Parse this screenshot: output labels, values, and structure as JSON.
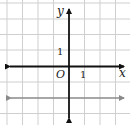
{
  "diagram": {
    "type": "coordinate-plane",
    "axes": {
      "x_label": "x",
      "y_label": "y",
      "origin_label": "O",
      "x_tick_label": "1",
      "y_tick_label": "1",
      "color": "#111111"
    },
    "grid": {
      "color": "#cfcfcf",
      "unit_px": 15.5,
      "x_range": [
        -4,
        3
      ],
      "y_range": [
        -3,
        4
      ]
    },
    "lines": [
      {
        "name": "horizontal-line-y-neg2",
        "equation": "y = -2",
        "color": "#8a8a8a"
      }
    ]
  }
}
